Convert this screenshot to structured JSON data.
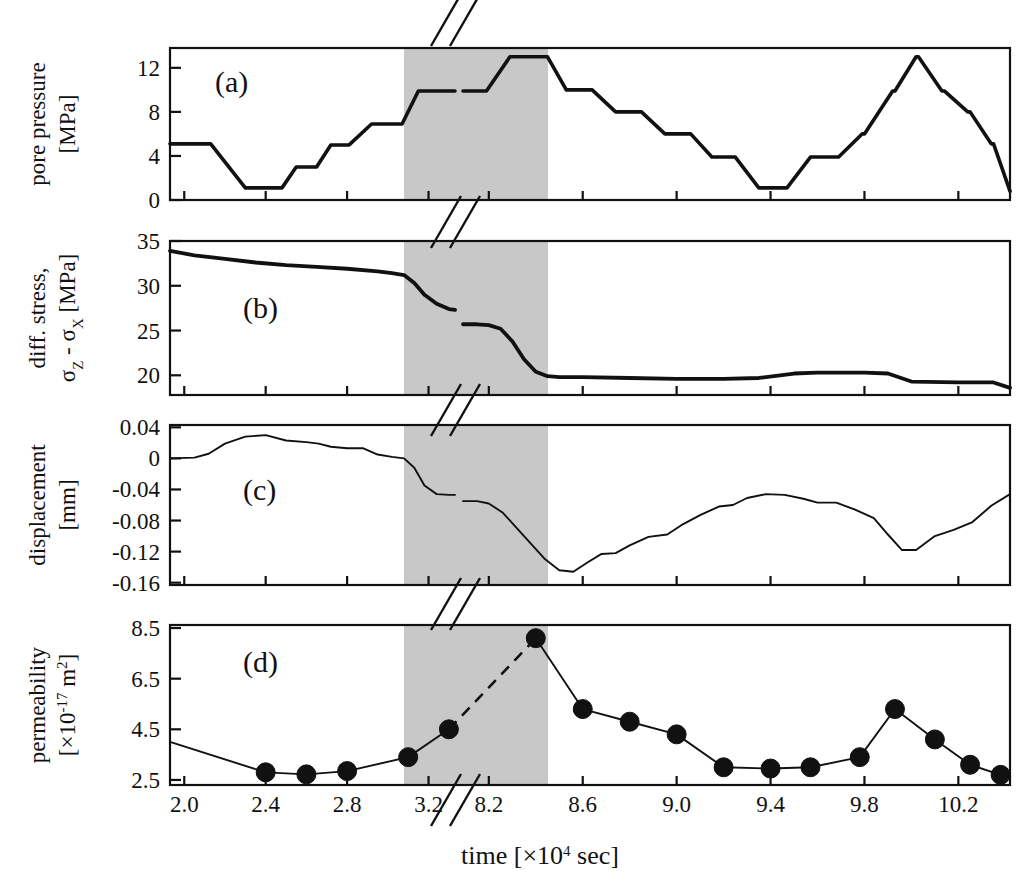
{
  "figure": {
    "x_axis_title_main": "time [",
    "x_axis_title_mult": "×10",
    "x_axis_title_exp": "4",
    "x_axis_title_unit": " sec]",
    "x_ticks_left": [
      "2.0",
      "2.4",
      "2.8",
      "3.2"
    ],
    "x_ticks_right": [
      "8.2",
      "8.6",
      "9.0",
      "9.4",
      "9.8",
      "10.2"
    ],
    "axis_break_symbol": "//",
    "shaded_band_color": "#c8c8c8",
    "line_color": "#111111",
    "marker_color": "#111111",
    "background_color": "#ffffff"
  },
  "panels": [
    {
      "tag": "(a)",
      "ylabel_line1": "pore pressure",
      "ylabel_line2": "[MPa]",
      "yticks": [
        "0",
        "4",
        "8",
        "12"
      ]
    },
    {
      "tag": "(b)",
      "ylabel_line1": "diff. stress,",
      "ylabel_line2_a": "σ",
      "ylabel_line2_b": "Z",
      "ylabel_line2_c": " - ",
      "ylabel_line2_d": "σ",
      "ylabel_line2_e": "X",
      "ylabel_line2_f": " [MPa]",
      "yticks": [
        "20",
        "25",
        "30",
        "35"
      ]
    },
    {
      "tag": "(c)",
      "ylabel_line1": "displacement",
      "ylabel_line2": "[mm]",
      "yticks": [
        "-0.16",
        "-0.12",
        "-0.08",
        "-0.04",
        "0",
        "0.04"
      ]
    },
    {
      "tag": "(d)",
      "ylabel_line1": "permeability",
      "ylabel_line2_a": "[×10",
      "ylabel_line2_b": "-17",
      "ylabel_line2_c": " m",
      "ylabel_line2_d": "2",
      "ylabel_line2_e": "]",
      "yticks": [
        "2.5",
        "4.5",
        "6.5",
        "8.5"
      ]
    }
  ],
  "chart_data": [
    {
      "type": "line",
      "title": "(a) pore pressure",
      "xlabel": "time [×10^4 sec]",
      "ylabel": "pore pressure [MPa]",
      "ylim": [
        0,
        13.8
      ],
      "xlim_left": [
        1.93,
        3.33
      ],
      "xlim_right": [
        8.09,
        10.42
      ],
      "grid": false,
      "legend": "none",
      "note": "stepped pore-pressure cycling; axis broken between 3.33 and 8.09",
      "segment_left": {
        "x": [
          1.93,
          2.12,
          2.13,
          2.3,
          2.31,
          2.47,
          2.48,
          2.55,
          2.56,
          2.64,
          2.65,
          2.72,
          2.73,
          2.8,
          2.81,
          2.92,
          2.93,
          3.06,
          3.07,
          3.15,
          3.16,
          3.33
        ],
        "y": [
          5.1,
          5.1,
          5.1,
          1.1,
          1.1,
          1.1,
          1.1,
          3.0,
          3.0,
          3.0,
          3.0,
          5.0,
          5.0,
          5.0,
          5.0,
          6.9,
          6.9,
          6.9,
          6.9,
          9.9,
          9.9,
          9.9
        ]
      },
      "segment_right": {
        "x": [
          8.09,
          8.18,
          8.19,
          8.29,
          8.3,
          8.44,
          8.45,
          8.53,
          8.54,
          8.63,
          8.64,
          8.74,
          8.75,
          8.84,
          8.85,
          8.95,
          8.96,
          9.05,
          9.06,
          9.15,
          9.16,
          9.24,
          9.25,
          9.35,
          9.36,
          9.46,
          9.47,
          9.57,
          9.58,
          9.68,
          9.69,
          9.79,
          9.8,
          9.92,
          9.93,
          10.02,
          10.03,
          10.13,
          10.14,
          10.24,
          10.25,
          10.34,
          10.35,
          10.42
        ],
        "y": [
          9.9,
          9.9,
          9.9,
          13.0,
          13.0,
          13.0,
          13.0,
          10.0,
          10.0,
          10.0,
          10.0,
          8.0,
          8.0,
          8.0,
          8.0,
          6.0,
          6.0,
          6.0,
          6.0,
          3.9,
          3.9,
          3.9,
          3.9,
          1.1,
          1.1,
          1.1,
          1.1,
          3.9,
          3.9,
          3.9,
          3.9,
          6.0,
          6.0,
          9.9,
          9.9,
          13.0,
          13.0,
          9.9,
          9.9,
          8.0,
          8.0,
          5.1,
          5.1,
          0.8
        ]
      }
    },
    {
      "type": "line",
      "title": "(b) differential stress",
      "xlabel": "time [×10^4 sec]",
      "ylabel": "diff. stress, σZ - σX [MPa]",
      "ylim": [
        17.8,
        35
      ],
      "grid": false,
      "legend": "none",
      "note": "stress decays from ~34 MPa, drops to ~27 at first failure, resets to ~25.7, then drops to ~19.8 after second failure",
      "segment_left": {
        "x": [
          1.93,
          2.05,
          2.2,
          2.35,
          2.5,
          2.65,
          2.8,
          2.95,
          3.02,
          3.08,
          3.13,
          3.18,
          3.24,
          3.3,
          3.33
        ],
        "y": [
          33.9,
          33.4,
          33.0,
          32.6,
          32.3,
          32.1,
          31.9,
          31.6,
          31.4,
          31.2,
          30.3,
          29.0,
          28.0,
          27.4,
          27.3
        ]
      },
      "segment_right": {
        "x": [
          8.09,
          8.15,
          8.2,
          8.25,
          8.3,
          8.35,
          8.4,
          8.45,
          8.5,
          8.6,
          8.8,
          9.0,
          9.2,
          9.35,
          9.5,
          9.6,
          9.7,
          9.8,
          9.9,
          10.0,
          10.2,
          10.35,
          10.42
        ],
        "y": [
          25.7,
          25.7,
          25.6,
          25.2,
          23.8,
          21.8,
          20.4,
          19.9,
          19.8,
          19.8,
          19.7,
          19.6,
          19.6,
          19.7,
          20.2,
          20.3,
          20.3,
          20.3,
          20.2,
          19.3,
          19.2,
          19.2,
          18.6
        ]
      }
    },
    {
      "type": "line",
      "title": "(c) displacement",
      "xlabel": "time [×10^4 sec]",
      "ylabel": "displacement [mm]",
      "ylim": [
        -0.16,
        0.04
      ],
      "grid": false,
      "legend": "none",
      "note": "displacement rises to ~+0.03 then steps down through failure to ~-0.145, then recovers stepwise",
      "segment_left": {
        "x": [
          1.93,
          2.05,
          2.12,
          2.2,
          2.3,
          2.4,
          2.5,
          2.6,
          2.66,
          2.72,
          2.8,
          2.88,
          2.95,
          3.02,
          3.08,
          3.13,
          3.18,
          3.24,
          3.3,
          3.33
        ],
        "y": [
          0.0,
          0.001,
          0.006,
          0.019,
          0.028,
          0.03,
          0.023,
          0.021,
          0.019,
          0.015,
          0.013,
          0.013,
          0.005,
          0.002,
          0.0,
          -0.012,
          -0.035,
          -0.046,
          -0.047,
          -0.047
        ]
      },
      "segment_right": {
        "x": [
          8.09,
          8.15,
          8.2,
          8.26,
          8.32,
          8.38,
          8.44,
          8.5,
          8.56,
          8.62,
          8.68,
          8.74,
          8.8,
          8.88,
          8.96,
          9.02,
          9.1,
          9.18,
          9.24,
          9.3,
          9.38,
          9.46,
          9.54,
          9.6,
          9.68,
          9.76,
          9.84,
          9.9,
          9.96,
          10.02,
          10.1,
          10.18,
          10.26,
          10.34,
          10.42
        ],
        "y": [
          -0.055,
          -0.055,
          -0.058,
          -0.07,
          -0.09,
          -0.11,
          -0.13,
          -0.144,
          -0.146,
          -0.134,
          -0.123,
          -0.122,
          -0.112,
          -0.101,
          -0.098,
          -0.086,
          -0.073,
          -0.062,
          -0.06,
          -0.051,
          -0.046,
          -0.047,
          -0.052,
          -0.057,
          -0.057,
          -0.066,
          -0.077,
          -0.098,
          -0.118,
          -0.118,
          -0.1,
          -0.092,
          -0.082,
          -0.061,
          -0.046
        ]
      }
    },
    {
      "type": "scatter-line",
      "title": "(d) permeability",
      "xlabel": "time [×10^4 sec]",
      "ylabel": "permeability [×10^-17 m^2]",
      "ylim": [
        2.3,
        8.5
      ],
      "grid": false,
      "legend": "none",
      "note": "filled circle markers joined by solid line; dashed line spans the axis break",
      "points_left": [
        {
          "x": 1.93,
          "y": 4.0,
          "marker": false
        },
        {
          "x": 2.4,
          "y": 2.8,
          "marker": true
        },
        {
          "x": 2.6,
          "y": 2.72,
          "marker": true
        },
        {
          "x": 2.8,
          "y": 2.85,
          "marker": true
        },
        {
          "x": 3.1,
          "y": 3.4,
          "marker": true
        },
        {
          "x": 3.3,
          "y": 4.5,
          "marker": true
        }
      ],
      "points_right": [
        {
          "x": 8.4,
          "y": 8.1,
          "marker": true
        },
        {
          "x": 8.6,
          "y": 5.3,
          "marker": true
        },
        {
          "x": 8.8,
          "y": 4.8,
          "marker": true
        },
        {
          "x": 9.0,
          "y": 4.3,
          "marker": true
        },
        {
          "x": 9.2,
          "y": 3.0,
          "marker": true
        },
        {
          "x": 9.4,
          "y": 2.95,
          "marker": true
        },
        {
          "x": 9.57,
          "y": 3.0,
          "marker": true
        },
        {
          "x": 9.78,
          "y": 3.4,
          "marker": true
        },
        {
          "x": 9.93,
          "y": 5.3,
          "marker": true
        },
        {
          "x": 10.1,
          "y": 4.1,
          "marker": true
        },
        {
          "x": 10.25,
          "y": 3.1,
          "marker": true
        },
        {
          "x": 10.38,
          "y": 2.7,
          "marker": true
        }
      ],
      "dashed_bridge": [
        {
          "x": 3.3,
          "y": 4.5
        },
        {
          "x": 8.4,
          "y": 8.1
        }
      ]
    }
  ],
  "shaded_region": {
    "label": "failure interval",
    "x_start": 3.2,
    "x_end": 8.45
  }
}
